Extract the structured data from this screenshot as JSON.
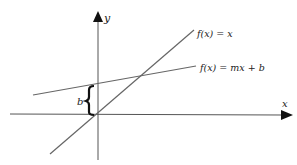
{
  "diagram": {
    "type": "line-graph",
    "axes": {
      "x_label": "x",
      "y_label": "y"
    },
    "lines": [
      {
        "id": "identity",
        "label": "f(x) = x"
      },
      {
        "id": "linear",
        "label": "f(x) = mx + b"
      }
    ],
    "annotations": [
      {
        "id": "intercept-brace",
        "label": "b"
      }
    ],
    "colors": {
      "axis": "#555555",
      "line": "#666666",
      "brace": "#111111",
      "text": "#222222"
    }
  }
}
